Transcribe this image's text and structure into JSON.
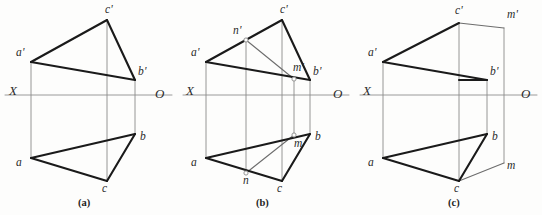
{
  "figure": {
    "background_color": "#fdfdfc",
    "ink_color": "#1a1a1a",
    "thin_line_color": "#8a8a8a",
    "axis_color": "#9a9a9a"
  },
  "panels": [
    {
      "id": "a",
      "caption": "(a)",
      "caption_pos": {
        "x": 78,
        "y": 198
      },
      "axis": {
        "label_x": "X",
        "label_o": "O",
        "y": 95,
        "x_start": 5,
        "x_end": 172
      },
      "axis_label_x_pos": {
        "x": 9,
        "y": 84
      },
      "axis_label_o_pos": {
        "x": 155,
        "y": 87
      },
      "points": [
        {
          "name": "a-prime",
          "label": "a'",
          "x": 31,
          "y": 62,
          "lx": 16,
          "ly": 47
        },
        {
          "name": "c-prime",
          "label": "c'",
          "x": 107,
          "y": 20,
          "lx": 105,
          "ly": 4
        },
        {
          "name": "b-prime",
          "label": "b'",
          "x": 135,
          "y": 80,
          "lx": 138,
          "ly": 66
        },
        {
          "name": "a",
          "label": "a",
          "x": 31,
          "y": 158,
          "lx": 16,
          "ly": 157
        },
        {
          "name": "c",
          "label": "c",
          "x": 107,
          "y": 181,
          "lx": 102,
          "ly": 183
        },
        {
          "name": "b",
          "label": "b",
          "x": 135,
          "y": 134,
          "lx": 140,
          "ly": 131
        }
      ],
      "thick_edges": [
        {
          "name": "edge-a-prime-c-prime",
          "x1": 31,
          "y1": 62,
          "x2": 107,
          "y2": 20
        },
        {
          "name": "edge-c-prime-b-prime",
          "x1": 107,
          "y1": 20,
          "x2": 135,
          "y2": 80
        },
        {
          "name": "edge-a-prime-b-prime",
          "x1": 31,
          "y1": 62,
          "x2": 135,
          "y2": 80
        },
        {
          "name": "edge-a-c",
          "x1": 31,
          "y1": 158,
          "x2": 107,
          "y2": 181
        },
        {
          "name": "edge-c-b",
          "x1": 107,
          "y1": 181,
          "x2": 135,
          "y2": 134
        },
        {
          "name": "edge-a-b",
          "x1": 31,
          "y1": 158,
          "x2": 135,
          "y2": 134
        }
      ],
      "projection_lines": [
        {
          "name": "proj-line-a",
          "x1": 31,
          "y1": 62,
          "x2": 31,
          "y2": 158
        },
        {
          "name": "proj-line-c",
          "x1": 107,
          "y1": 20,
          "x2": 107,
          "y2": 181
        },
        {
          "name": "proj-line-b",
          "x1": 135,
          "y1": 80,
          "x2": 135,
          "y2": 134
        }
      ],
      "thin_edges": []
    },
    {
      "id": "b",
      "caption": "(b)",
      "caption_pos": {
        "x": 256,
        "y": 198
      },
      "axis": {
        "label_x": "X",
        "label_o": "O",
        "y": 95,
        "x_start": 183,
        "x_end": 349
      },
      "axis_label_x_pos": {
        "x": 186,
        "y": 84
      },
      "axis_label_o_pos": {
        "x": 333,
        "y": 87
      },
      "points": [
        {
          "name": "a-prime",
          "label": "a'",
          "x": 206,
          "y": 62,
          "lx": 191,
          "ly": 47
        },
        {
          "name": "c-prime",
          "label": "c'",
          "x": 282,
          "y": 20,
          "lx": 280,
          "ly": 4
        },
        {
          "name": "b-prime",
          "label": "b'",
          "x": 310,
          "y": 80,
          "lx": 313,
          "ly": 66
        },
        {
          "name": "a",
          "label": "a",
          "x": 206,
          "y": 158,
          "lx": 191,
          "ly": 157
        },
        {
          "name": "c",
          "label": "c",
          "x": 282,
          "y": 181,
          "lx": 277,
          "ly": 183
        },
        {
          "name": "b",
          "label": "b",
          "x": 310,
          "y": 134,
          "lx": 315,
          "ly": 131
        },
        {
          "name": "n-prime",
          "label": "n'",
          "x": 246,
          "y": 40,
          "lx": 233,
          "ly": 25
        },
        {
          "name": "m-prime",
          "label": "m'",
          "x": 294,
          "y": 79,
          "lx": 293,
          "ly": 62
        },
        {
          "name": "n",
          "label": "n",
          "x": 246,
          "y": 173,
          "lx": 243,
          "ly": 175
        },
        {
          "name": "m",
          "label": "m",
          "x": 294,
          "y": 135,
          "lx": 294,
          "ly": 138
        }
      ],
      "thick_edges": [
        {
          "name": "edge-a-prime-c-prime",
          "x1": 206,
          "y1": 62,
          "x2": 282,
          "y2": 20
        },
        {
          "name": "edge-c-prime-b-prime",
          "x1": 282,
          "y1": 20,
          "x2": 310,
          "y2": 80
        },
        {
          "name": "edge-a-prime-b-prime",
          "x1": 206,
          "y1": 62,
          "x2": 310,
          "y2": 80
        },
        {
          "name": "edge-a-c",
          "x1": 206,
          "y1": 158,
          "x2": 282,
          "y2": 181
        },
        {
          "name": "edge-c-b",
          "x1": 282,
          "y1": 181,
          "x2": 310,
          "y2": 134
        },
        {
          "name": "edge-a-b",
          "x1": 206,
          "y1": 158,
          "x2": 310,
          "y2": 134
        }
      ],
      "projection_lines": [
        {
          "name": "proj-line-a",
          "x1": 206,
          "y1": 62,
          "x2": 206,
          "y2": 158
        },
        {
          "name": "proj-line-c",
          "x1": 282,
          "y1": 20,
          "x2": 282,
          "y2": 181
        },
        {
          "name": "proj-line-b",
          "x1": 310,
          "y1": 80,
          "x2": 310,
          "y2": 134
        },
        {
          "name": "proj-line-n",
          "x1": 246,
          "y1": 40,
          "x2": 246,
          "y2": 173
        },
        {
          "name": "proj-line-m",
          "x1": 294,
          "y1": 79,
          "x2": 294,
          "y2": 135
        }
      ],
      "thin_edges": [
        {
          "name": "line-n-prime-m-prime",
          "x1": 246,
          "y1": 40,
          "x2": 294,
          "y2": 79
        },
        {
          "name": "line-n-m",
          "x1": 246,
          "y1": 173,
          "x2": 294,
          "y2": 135
        }
      ]
    },
    {
      "id": "c",
      "caption": "(c)",
      "caption_pos": {
        "x": 448,
        "y": 198
      },
      "axis": {
        "label_x": "X",
        "label_o": "O",
        "y": 95,
        "x_start": 360,
        "x_end": 537
      },
      "axis_label_x_pos": {
        "x": 363,
        "y": 84
      },
      "axis_label_o_pos": {
        "x": 521,
        "y": 87
      },
      "points": [
        {
          "name": "a-prime",
          "label": "a'",
          "x": 383,
          "y": 62,
          "lx": 368,
          "ly": 47
        },
        {
          "name": "c-prime",
          "label": "c'",
          "x": 459,
          "y": 23,
          "lx": 455,
          "ly": 5
        },
        {
          "name": "b-prime",
          "label": "b'",
          "x": 487,
          "y": 80,
          "lx": 490,
          "ly": 66
        },
        {
          "name": "a",
          "label": "a",
          "x": 383,
          "y": 158,
          "lx": 368,
          "ly": 157
        },
        {
          "name": "c",
          "label": "c",
          "x": 459,
          "y": 181,
          "lx": 454,
          "ly": 183
        },
        {
          "name": "b",
          "label": "b",
          "x": 487,
          "y": 134,
          "lx": 492,
          "ly": 131
        },
        {
          "name": "m-prime",
          "label": "m'",
          "x": 504,
          "y": 28,
          "lx": 507,
          "ly": 9
        },
        {
          "name": "m",
          "label": "m",
          "x": 504,
          "y": 163,
          "lx": 507,
          "ly": 160
        }
      ],
      "thick_edges": [
        {
          "name": "edge-a-prime-c-prime",
          "x1": 383,
          "y1": 62,
          "x2": 459,
          "y2": 23
        },
        {
          "name": "edge-a-prime-b-prime",
          "x1": 383,
          "y1": 62,
          "x2": 487,
          "y2": 80
        },
        {
          "name": "edge-a-c",
          "x1": 383,
          "y1": 158,
          "x2": 459,
          "y2": 181
        },
        {
          "name": "edge-c-b",
          "x1": 459,
          "y1": 181,
          "x2": 487,
          "y2": 134
        },
        {
          "name": "edge-a-b",
          "x1": 383,
          "y1": 158,
          "x2": 487,
          "y2": 134
        },
        {
          "name": "edge-b-prime-stub",
          "x1": 459,
          "y1": 80,
          "x2": 487,
          "y2": 80
        }
      ],
      "projection_lines": [
        {
          "name": "proj-line-a",
          "x1": 383,
          "y1": 62,
          "x2": 383,
          "y2": 158
        },
        {
          "name": "proj-line-c",
          "x1": 459,
          "y1": 23,
          "x2": 459,
          "y2": 181
        },
        {
          "name": "proj-line-b",
          "x1": 487,
          "y1": 80,
          "x2": 487,
          "y2": 134
        },
        {
          "name": "proj-line-m",
          "x1": 504,
          "y1": 28,
          "x2": 504,
          "y2": 163
        }
      ],
      "thin_edges": [
        {
          "name": "line-c-prime-m-prime",
          "x1": 459,
          "y1": 23,
          "x2": 504,
          "y2": 28
        },
        {
          "name": "line-c-m",
          "x1": 459,
          "y1": 181,
          "x2": 504,
          "y2": 163
        }
      ]
    }
  ]
}
